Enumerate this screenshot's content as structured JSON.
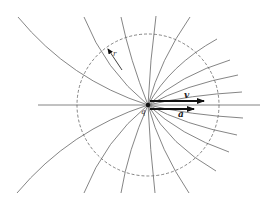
{
  "figure": {
    "labels": {
      "charge": "q",
      "velocity": "v",
      "acceleration": "a",
      "radius": "r"
    },
    "colors": {
      "line": "#555555",
      "arrow": "#111111",
      "circle": "#555555"
    },
    "center": [
      148,
      105
    ],
    "circle_radius": 71,
    "field_line_ends": {
      "top": [
        [
          18,
          17
        ],
        [
          84,
          17
        ],
        [
          121,
          17
        ],
        [
          156,
          16
        ],
        [
          190,
          17
        ],
        [
          217,
          39
        ],
        [
          230,
          60
        ],
        [
          238,
          75
        ],
        [
          242,
          92
        ]
      ],
      "bottom": [
        [
          17,
          193
        ],
        [
          84,
          193
        ],
        [
          121,
          193
        ],
        [
          155,
          193
        ],
        [
          189,
          193
        ],
        [
          216,
          171
        ],
        [
          229,
          152
        ],
        [
          237,
          135
        ],
        [
          243,
          118
        ]
      ]
    }
  }
}
